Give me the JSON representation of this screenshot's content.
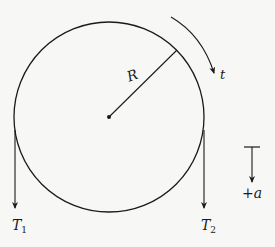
{
  "diagram": {
    "type": "pulley-free-body",
    "colors": {
      "background": "#f7f7f6",
      "stroke": "#1a1a1a"
    },
    "pulley": {
      "center": [
        109,
        117
      ],
      "radius": 95,
      "radius_label": "R"
    },
    "rotation_arrow": {
      "label": "t"
    },
    "tensions": [
      {
        "label": "T",
        "subscript": "1",
        "side": "left"
      },
      {
        "label": "T",
        "subscript": "2",
        "side": "right"
      }
    ],
    "acceleration_indicator": {
      "sign": "+",
      "label": "a"
    }
  }
}
